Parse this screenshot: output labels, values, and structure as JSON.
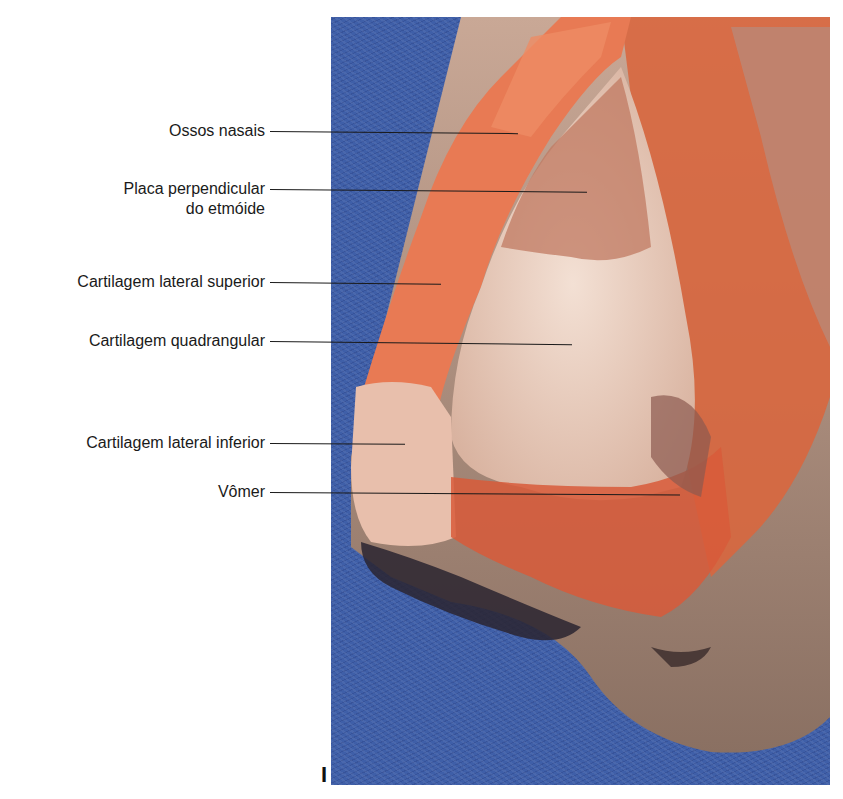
{
  "figure": {
    "panel_letter": "I",
    "colors": {
      "drape_blue": "#3f5fa8",
      "tissue_red": "#e0603a",
      "cartilage_pale": "#ecd2c2",
      "skin": "#b89a88",
      "label_text": "#1a1a1a"
    },
    "labels": [
      {
        "text": "Ossos nasais",
        "line2": ""
      },
      {
        "text": "Placa perpendicular",
        "line2": "do etmóide"
      },
      {
        "text": "Cartilagem lateral superior",
        "line2": ""
      },
      {
        "text": "Cartilagem quadrangular",
        "line2": ""
      },
      {
        "text": "Cartilagem lateral inferior",
        "line2": ""
      },
      {
        "text": "Vômer",
        "line2": ""
      }
    ]
  }
}
